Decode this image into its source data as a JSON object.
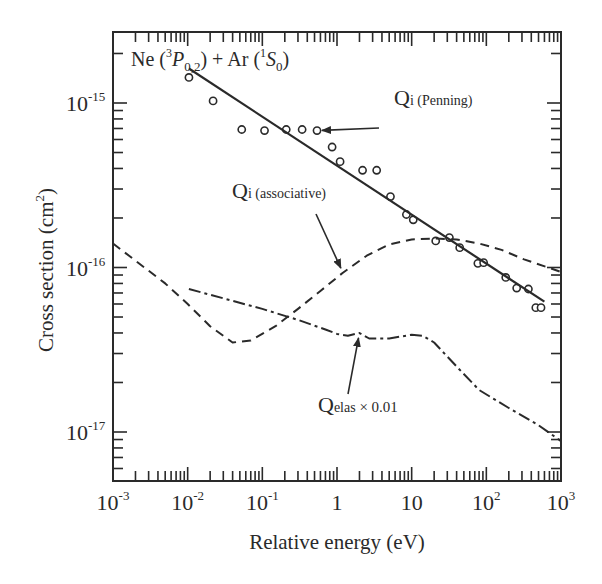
{
  "chart_data": {
    "type": "line",
    "title": "Ne (3P0,2) + Ar (1S0)",
    "title_parts": {
      "base": "Ne (",
      "sup1": "3",
      "italic": "P",
      "sub1": "0,2",
      "mid": ") + Ar (",
      "sup2": "1",
      "italic2": "S",
      "sub2": "0",
      "end": ")"
    },
    "xlabel": "Relative energy (eV)",
    "ylabel": "Cross section  (cm",
    "ylabel_sup": "2",
    "ylabel_end": ")",
    "xscale": "log",
    "yscale": "log",
    "xlim": [
      0.001,
      1000
    ],
    "ylim": [
      4.5e-18,
      5e-15
    ],
    "grid": false,
    "x_ticks": [
      {
        "base": "10",
        "exp": "-3",
        "value": 0.001
      },
      {
        "base": "10",
        "exp": "-2",
        "value": 0.01
      },
      {
        "base": "10",
        "exp": "-1",
        "value": 0.1
      },
      {
        "base": "1",
        "exp": "",
        "value": 1
      },
      {
        "base": "10",
        "exp": "",
        "value": 10
      },
      {
        "base": "10",
        "exp": "2",
        "value": 100
      },
      {
        "base": "10",
        "exp": "3",
        "value": 1000
      }
    ],
    "y_ticks": [
      {
        "base": "10",
        "exp": "-15",
        "value": 1e-15
      },
      {
        "base": "10",
        "exp": "-16",
        "value": 1e-16
      },
      {
        "base": "10",
        "exp": "-17",
        "value": 1e-17
      }
    ],
    "series": [
      {
        "name": "Qi (Penning) — experimental",
        "style": "circles",
        "x": [
          0.0104,
          0.0219,
          0.053,
          0.107,
          0.209,
          0.341,
          0.54,
          0.86,
          1.1,
          2.2,
          3.4,
          5.2,
          8.5,
          10.5,
          21,
          32,
          44,
          77,
          92,
          182,
          255,
          366,
          460,
          540
        ],
        "y": [
          1.43e-15,
          1.03e-15,
          6.9e-16,
          6.8e-16,
          6.9e-16,
          6.9e-16,
          6.8e-16,
          5.4e-16,
          4.4e-16,
          3.9e-16,
          3.9e-16,
          2.7e-16,
          2.1e-16,
          1.95e-16,
          1.45e-16,
          1.52e-16,
          1.32e-16,
          1.06e-16,
          1.07e-16,
          8.7e-17,
          7.5e-17,
          7.4e-17,
          5.7e-17,
          5.7e-17
        ]
      },
      {
        "name": "Qi (Penning) — fit",
        "style": "solid",
        "x": [
          0.0104,
          600
        ],
        "y": [
          1.62e-15,
          6.2e-17
        ]
      },
      {
        "name": "Qi (associative)",
        "style": "dashed",
        "x": [
          0.001,
          0.002,
          0.005,
          0.01,
          0.02,
          0.04,
          0.07,
          0.15,
          0.3,
          0.6,
          1.2,
          2.5,
          5,
          10,
          20,
          40,
          80,
          160,
          320,
          1000
        ],
        "y": [
          1.4e-16,
          1.1e-16,
          8e-17,
          6e-17,
          4.4e-17,
          3.5e-17,
          3.6e-17,
          4.4e-17,
          5.6e-17,
          7.2e-17,
          9.3e-17,
          1.18e-16,
          1.38e-16,
          1.48e-16,
          1.5e-16,
          1.48e-16,
          1.4e-16,
          1.28e-16,
          1.12e-16,
          9.4e-17
        ]
      },
      {
        "name": "Qelas × 0.01",
        "style": "dash-dot",
        "x": [
          0.0104,
          0.03,
          0.1,
          0.3,
          0.7,
          1.0,
          1.4,
          2.0,
          2.7,
          5,
          7,
          10,
          14,
          20,
          40,
          80,
          200,
          500,
          1000
        ],
        "y": [
          7.4e-17,
          6.5e-17,
          5.6e-17,
          4.8e-17,
          4.2e-17,
          3.95e-17,
          3.85e-17,
          4e-17,
          3.7e-17,
          3.7e-17,
          3.8e-17,
          3.9e-17,
          3.85e-17,
          3.5e-17,
          2.5e-17,
          1.8e-17,
          1.4e-17,
          1.1e-17,
          8.8e-18
        ]
      }
    ],
    "annotations": [
      {
        "id": "penning",
        "main": "Q",
        "sub": "i (Penning)",
        "arrow_to": [
          0.54,
          6.8e-16
        ]
      },
      {
        "id": "associative",
        "main": "Q",
        "sub": "i (associative)",
        "arrow_to": [
          1.2,
          9.3e-17
        ]
      },
      {
        "id": "elastic",
        "main": "Q",
        "sub": "elas",
        "suffix": " × 0.01",
        "arrow_to": [
          2.0,
          4e-17
        ]
      }
    ],
    "colors": {
      "ink": "#2a2a2a",
      "background": "#ffffff"
    }
  }
}
